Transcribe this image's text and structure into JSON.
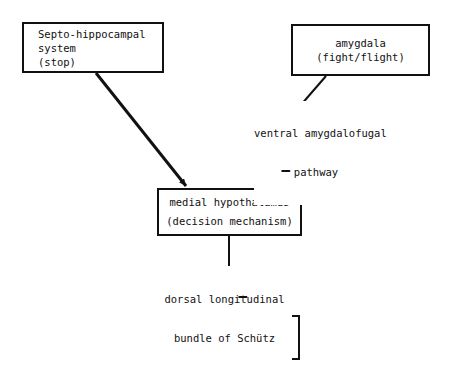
{
  "diagram": {
    "background_color": "#ffffff",
    "stroke_color": "#111111",
    "nodes": [
      {
        "id": "septo-hippocampal",
        "lines": [
          "Septo-hippocampal",
          "system",
          "(stop)"
        ]
      },
      {
        "id": "amygdala",
        "lines": [
          "amygdala",
          "(fight/flight)"
        ]
      },
      {
        "id": "medial-hypothalamus",
        "lines": [
          "medial hypothalamus",
          "(decision mechanism)"
        ]
      },
      {
        "id": "central-grey",
        "lines": [
          "central grey",
          "(fight/flight)"
        ]
      }
    ],
    "edge_labels": [
      {
        "id": "ventral-amygdalofugal",
        "lines": [
          "ventral amygdalofugal",
          "pathway"
        ]
      },
      {
        "id": "dorsal-longitudinal",
        "lines": [
          "dorsal longitudinal",
          "bundle of Schütz"
        ]
      }
    ],
    "signs": [
      {
        "id": "amygdala-to-hypothalamus-sign",
        "symbol": "−"
      },
      {
        "id": "hypothalamus-to-central-grey-sign",
        "symbol": "−"
      }
    ]
  }
}
